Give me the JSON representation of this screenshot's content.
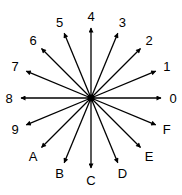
{
  "diagram": {
    "center": [
      91,
      98
    ],
    "arrow_length": 70,
    "label_radius": 82,
    "line_color": "#000000",
    "directions": [
      {
        "label": "0",
        "angle_deg": 0
      },
      {
        "label": "1",
        "angle_deg": 22.5
      },
      {
        "label": "2",
        "angle_deg": 45
      },
      {
        "label": "3",
        "angle_deg": 67.5
      },
      {
        "label": "4",
        "angle_deg": 90
      },
      {
        "label": "5",
        "angle_deg": 112.5
      },
      {
        "label": "6",
        "angle_deg": 135
      },
      {
        "label": "7",
        "angle_deg": 157.5
      },
      {
        "label": "8",
        "angle_deg": 180
      },
      {
        "label": "9",
        "angle_deg": 202.5
      },
      {
        "label": "A",
        "angle_deg": 225
      },
      {
        "label": "B",
        "angle_deg": 247.5
      },
      {
        "label": "C",
        "angle_deg": 270
      },
      {
        "label": "D",
        "angle_deg": 292.5
      },
      {
        "label": "E",
        "angle_deg": 315
      },
      {
        "label": "F",
        "angle_deg": 337.5
      }
    ]
  }
}
